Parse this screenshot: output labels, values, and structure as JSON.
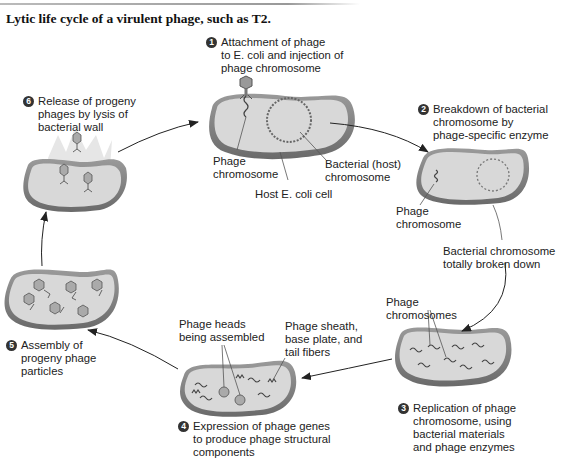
{
  "figure": {
    "title": "Lytic life cycle of a virulent phage, such as T2."
  },
  "steps": [
    {
      "number": "1",
      "lines": [
        "Attachment of phage",
        "to E. coli and injection of",
        "phage chromosome"
      ]
    },
    {
      "number": "2",
      "lines": [
        "Breakdown of bacterial",
        "chromosome by",
        "phage-specific enzyme"
      ]
    },
    {
      "number": "3",
      "lines": [
        "Replication of phage",
        "chromosome, using",
        "bacterial materials",
        "and phage enzymes"
      ]
    },
    {
      "number": "4",
      "lines": [
        "Expression of phage genes",
        "to produce phage structural",
        "components"
      ]
    },
    {
      "number": "5",
      "lines": [
        "Assembly of",
        "progeny phage",
        "particles"
      ]
    },
    {
      "number": "6",
      "lines": [
        "Release of progeny",
        "phages by lysis of",
        "bacterial wall"
      ]
    }
  ],
  "labels": {
    "phage_chromosome_1": [
      "Phage",
      "chromosome"
    ],
    "bacterial_host_chromosome": [
      "Bacterial (host)",
      "chromosome"
    ],
    "host_cell": "Host E. coli cell",
    "phage_chromosome_2": [
      "Phage",
      "chromosome"
    ],
    "bacterial_broken_down": [
      "Bacterial chromosome",
      "totally broken down"
    ],
    "phage_chromosomes_3": [
      "Phage",
      "chromosomes"
    ],
    "phage_heads": [
      "Phage heads",
      "being assembled"
    ],
    "phage_sheath": [
      "Phage sheath,",
      "base plate, and",
      "tail fibers"
    ]
  },
  "colors": {
    "cell_wall": "#8a8a8a",
    "cell_interior": "#d6d6d6",
    "cell_rim_dark": "#6f6f6f",
    "arrow": "#222222",
    "step_badge": "#333333"
  }
}
